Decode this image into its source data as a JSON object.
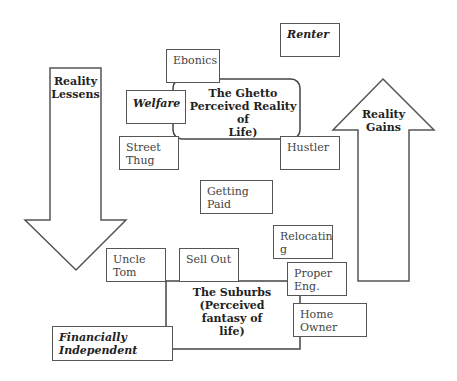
{
  "diagram": {
    "arrows": {
      "down": {
        "label_line1": "Reality",
        "label_line2": "Lessens"
      },
      "up": {
        "label_line1": "Reality",
        "label_line2": "Gains"
      }
    },
    "regions": {
      "ghetto": {
        "line1": "The Ghetto",
        "line2": "Perceived Reality of",
        "line3": "Life)"
      },
      "suburbs": {
        "line1": "The Suburbs",
        "line2": "(Perceived fantasy of",
        "line3": "life)"
      }
    },
    "boxes": {
      "renter": {
        "line1": "Renter"
      },
      "ebonics": {
        "line1": "Ebonics"
      },
      "welfare": {
        "line1": "Welfare"
      },
      "street_thug": {
        "line1": "Street",
        "line2": "Thug"
      },
      "hustler": {
        "line1": "Hustler"
      },
      "getting_paid": {
        "line1": "Getting",
        "line2": "Paid"
      },
      "relocating": {
        "line1": "Relocatin",
        "line2": "g"
      },
      "uncle_tom": {
        "line1": "Uncle",
        "line2": "Tom"
      },
      "sell_out": {
        "line1": "Sell Out"
      },
      "proper_eng": {
        "line1": "Proper",
        "line2": "Eng."
      },
      "home_owner": {
        "line1": "Home",
        "line2": "Owner"
      },
      "financially_independent": {
        "line1": "Financially",
        "line2": "Independent"
      }
    }
  }
}
